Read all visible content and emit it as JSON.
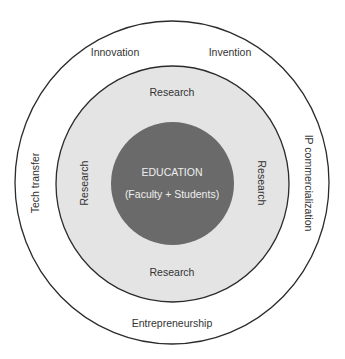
{
  "diagram": {
    "type": "concentric-circles",
    "colors": {
      "outer_fill": "#ffffff",
      "middle_fill": "#e4e4e4",
      "inner_fill": "#6a6a6a",
      "stroke": "#2b2b2b",
      "inner_text": "#eeeeee",
      "text": "#333333"
    },
    "core": {
      "title": "EDUCATION",
      "subtitle": "(Faculty + Students)"
    },
    "middle_ring": {
      "top": "Research",
      "left": "Research",
      "right": "Research",
      "bottom": "Research"
    },
    "outer_ring": {
      "top_left": "Innovation",
      "top_right": "Invention",
      "left": "Tech transfer",
      "right": "IP commercialization",
      "bottom": "Entrepreneurship"
    }
  }
}
